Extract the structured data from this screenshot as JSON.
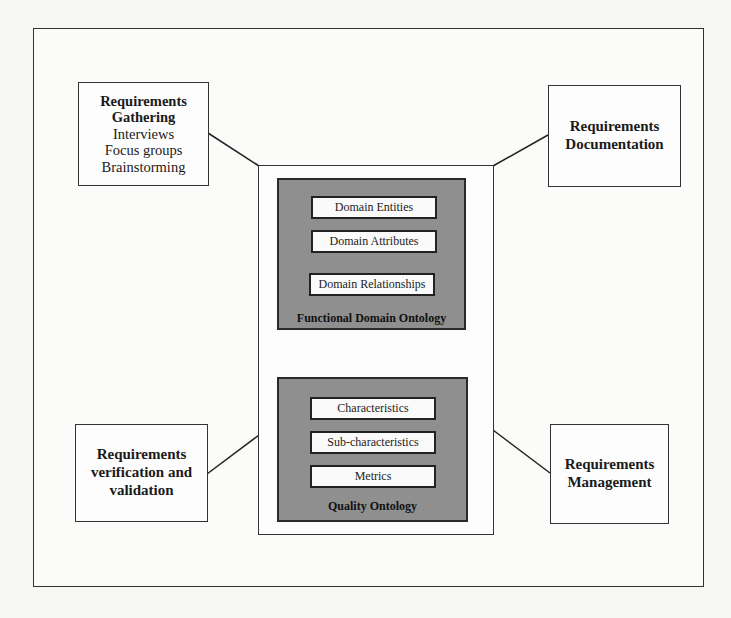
{
  "diagram": {
    "requirements_gathering": {
      "title_lines": [
        "Requirements",
        "Gathering"
      ],
      "items": [
        "Interviews",
        "Focus groups",
        "Brainstorming"
      ]
    },
    "requirements_documentation": {
      "title_lines": [
        "Requirements",
        "Documentation"
      ]
    },
    "requirements_verification": {
      "title_lines": [
        "Requirements",
        "verification and",
        "validation"
      ]
    },
    "requirements_management": {
      "title_lines": [
        "Requirements",
        "Management"
      ]
    },
    "functional_domain_ontology": {
      "label": "Functional Domain Ontology",
      "items": [
        "Domain Entities",
        "Domain Attributes",
        "Domain Relationships"
      ]
    },
    "quality_ontology": {
      "label": "Quality Ontology",
      "items": [
        "Characteristics",
        "Sub-characteristics",
        "Metrics"
      ]
    },
    "connector": {
      "type": "bidirectional-arrow"
    },
    "colors": {
      "ontology_fill": "#8f8f8f",
      "border": "#333333",
      "background": "#f6f6f4"
    }
  }
}
